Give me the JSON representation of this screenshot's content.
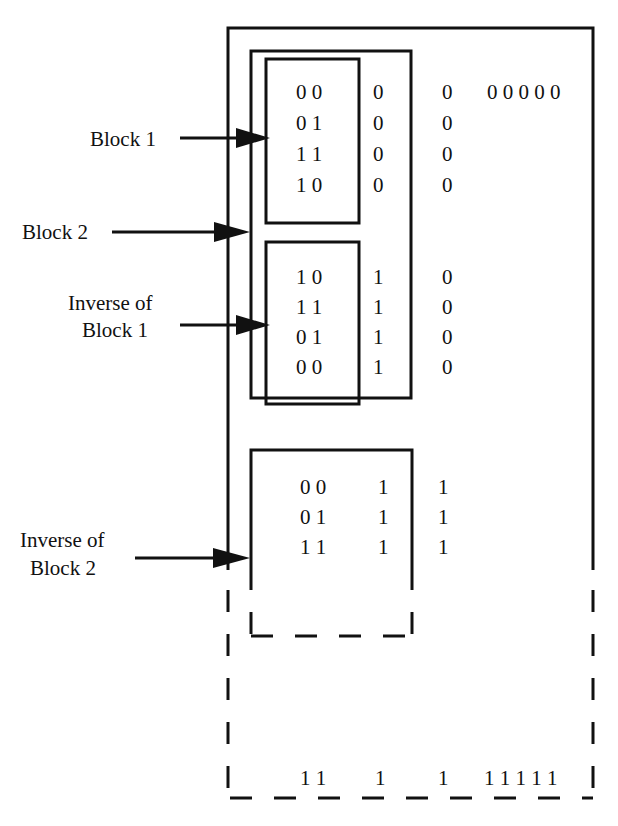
{
  "diagram": {
    "labels": {
      "block1": "Block 1",
      "block2": "Block 2",
      "inv_block1_line1": "Inverse of",
      "inv_block1_line2": "Block 1",
      "inv_block2_line1": "Inverse of",
      "inv_block2_line2": "Block 2"
    },
    "block1": {
      "rows": [
        {
          "pair": "0 0",
          "c3": "0",
          "c4": "0",
          "tail": "0 0 0 0 0"
        },
        {
          "pair": "0 1",
          "c3": "0",
          "c4": "0"
        },
        {
          "pair": "1 1",
          "c3": "0",
          "c4": "0"
        },
        {
          "pair": "1 0",
          "c3": "0",
          "c4": "0"
        }
      ]
    },
    "inverse_block1": {
      "rows": [
        {
          "pair": "1 0",
          "c3": "1",
          "c4": "0"
        },
        {
          "pair": "1 1",
          "c3": "1",
          "c4": "0"
        },
        {
          "pair": "0 1",
          "c3": "1",
          "c4": "0"
        },
        {
          "pair": "0 0",
          "c3": "1",
          "c4": "0"
        }
      ]
    },
    "inverse_block2": {
      "rows": [
        {
          "pair": "0 0",
          "c3": "1",
          "c4": "1"
        },
        {
          "pair": "0 1",
          "c3": "1",
          "c4": "1"
        },
        {
          "pair": "1 1",
          "c3": "1",
          "c4": "1"
        }
      ]
    },
    "last_row": {
      "pair": "1 1",
      "c3": "1",
      "c4": "1",
      "tail": "1 1 1 1 1"
    }
  }
}
